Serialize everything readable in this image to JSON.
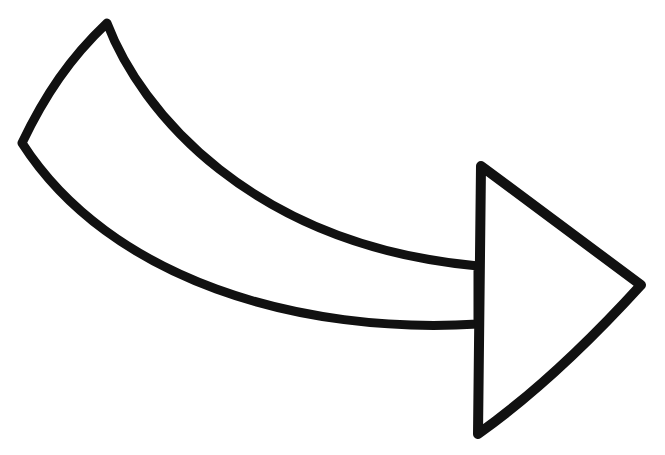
{
  "image": {
    "subject": "curved right-pointing arrow outline",
    "stroke_color": "#111111",
    "fill_color": "#ffffff",
    "background_color": "#ffffff"
  },
  "icon": {
    "name": "curved-arrow-right-icon",
    "label": "Curved arrow pointing right"
  }
}
